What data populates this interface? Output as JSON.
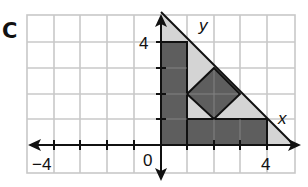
{
  "figure": {
    "panel_label": "C",
    "axes": {
      "x_label": "x",
      "y_label": "y",
      "x_ticks_labeled": [
        "−4",
        "0",
        "4"
      ],
      "y_ticks_labeled": [
        "4"
      ],
      "x_range": [
        -5,
        5
      ],
      "y_range": [
        -1,
        5
      ]
    },
    "colors": {
      "grid": "#c8c8c8",
      "dark_fill": "#5e5e5e",
      "light_fill": "#d4d4d4",
      "stroke": "#111111"
    },
    "shapes": {
      "outer_triangle": [
        [
          0,
          0
        ],
        [
          0,
          5
        ],
        [
          5,
          0
        ]
      ],
      "dark_rect_vertical": [
        [
          0,
          0
        ],
        [
          1,
          0
        ],
        [
          1,
          4
        ],
        [
          0,
          4
        ]
      ],
      "dark_rect_horizontal": [
        [
          1,
          0
        ],
        [
          4,
          0
        ],
        [
          4,
          1
        ],
        [
          1,
          1
        ]
      ],
      "dark_diamond": [
        [
          1,
          2
        ],
        [
          2,
          3
        ],
        [
          3,
          2
        ],
        [
          2,
          1
        ]
      ]
    }
  }
}
